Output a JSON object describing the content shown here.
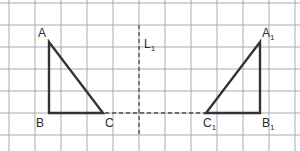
{
  "figure": {
    "kind": "reflection-diagram",
    "canvas": {
      "width": 300,
      "height": 151
    },
    "colors": {
      "background": "#ffffff",
      "grid_line": "#a9abad",
      "shape_stroke": "#333333",
      "dashed_line": "#4a4a4a",
      "label_text": "#2b2b2b"
    },
    "grid": {
      "visible": true,
      "x_spacing": 26,
      "y_spacing": 22,
      "x_start": 9,
      "y_start": 3,
      "x_count": 12,
      "y_count": 7,
      "stroke_width": 1
    },
    "mirror_line": {
      "name": "L1",
      "label": "L",
      "subscript": "1",
      "orientation": "vertical",
      "x": 139,
      "y_top": 25,
      "y_bottom": 135,
      "dash": "4 3",
      "label_x": 144,
      "label_y": 48
    },
    "base_connector": {
      "name": "CC1",
      "orientation": "horizontal",
      "x_start": 49,
      "x_end": 260,
      "y": 113,
      "dash": "4 3"
    },
    "triangles": [
      {
        "name": "ABC",
        "vertices": [
          {
            "id": "A",
            "label": "A",
            "subscript": "",
            "x": 49,
            "y": 42,
            "label_x": 38,
            "label_y": 37
          },
          {
            "id": "B",
            "label": "B",
            "subscript": "",
            "x": 49,
            "y": 113,
            "label_x": 36,
            "label_y": 127
          },
          {
            "id": "C",
            "label": "C",
            "subscript": "",
            "x": 103,
            "y": 113,
            "label_x": 105,
            "label_y": 127
          }
        ],
        "right_angle_at": "B"
      },
      {
        "name": "A1B1C1",
        "vertices": [
          {
            "id": "A1",
            "label": "A",
            "subscript": "1",
            "x": 260,
            "y": 42,
            "label_x": 262,
            "label_y": 37
          },
          {
            "id": "B1",
            "label": "B",
            "subscript": "1",
            "x": 260,
            "y": 113,
            "label_x": 262,
            "label_y": 127
          },
          {
            "id": "C1",
            "label": "C",
            "subscript": "1",
            "x": 206,
            "y": 113,
            "label_x": 203,
            "label_y": 127
          }
        ],
        "right_angle_at": "B1"
      }
    ]
  }
}
